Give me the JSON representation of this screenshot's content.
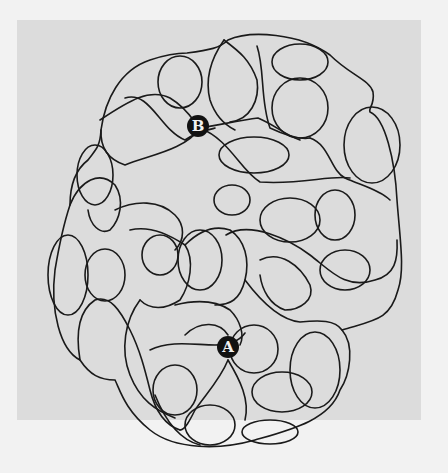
{
  "puzzle": {
    "type": "maze",
    "markers": [
      {
        "label": "B",
        "x": 198,
        "y": 126
      },
      {
        "label": "A",
        "x": 228,
        "y": 347
      }
    ],
    "colors": {
      "paper": "#dcdcdc",
      "line": "#1a1a1a",
      "marker": "#111111",
      "background": "#f2f2f2"
    }
  }
}
